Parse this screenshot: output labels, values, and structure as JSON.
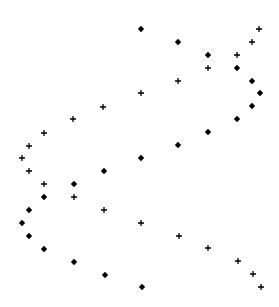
{
  "chart_data": {
    "type": "scatter",
    "title": "",
    "xlabel": "",
    "ylabel": "",
    "grid": false,
    "axes_visible": false,
    "legend": null,
    "marker_color": "#000000",
    "series": [
      {
        "name": "diamonds",
        "marker": "diamond",
        "points": [
          [
            141,
            29
          ],
          [
            178,
            42
          ],
          [
            208,
            55
          ],
          [
            237,
            68
          ],
          [
            252,
            81
          ],
          [
            260,
            93
          ],
          [
            252,
            106
          ],
          [
            237,
            119
          ],
          [
            208,
            132
          ],
          [
            178,
            145
          ],
          [
            141,
            158
          ],
          [
            104,
            171
          ],
          [
            74,
            184
          ],
          [
            44,
            197
          ],
          [
            29,
            210
          ],
          [
            22,
            223
          ],
          [
            29,
            236
          ],
          [
            44,
            249
          ],
          [
            74,
            262
          ],
          [
            105,
            275
          ],
          [
            142,
            287
          ]
        ]
      },
      {
        "name": "plus",
        "marker": "plus",
        "points": [
          [
            259,
            29
          ],
          [
            252,
            42
          ],
          [
            237,
            55
          ],
          [
            208,
            68
          ],
          [
            178,
            81
          ],
          [
            141,
            93
          ],
          [
            103,
            107
          ],
          [
            73,
            119
          ],
          [
            44,
            133
          ],
          [
            29,
            146
          ],
          [
            22,
            158
          ],
          [
            29,
            171
          ],
          [
            44,
            184
          ],
          [
            74,
            197
          ],
          [
            104,
            210
          ],
          [
            141,
            223
          ],
          [
            179,
            236
          ],
          [
            208,
            248
          ],
          [
            238,
            261
          ],
          [
            253,
            274
          ],
          [
            261,
            287
          ]
        ]
      }
    ]
  }
}
